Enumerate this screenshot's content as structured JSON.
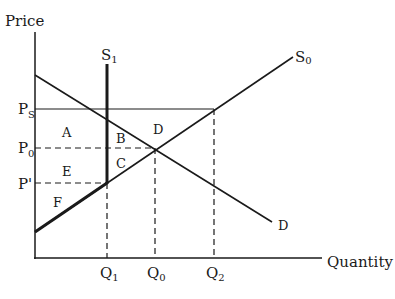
{
  "diagram": {
    "type": "supply-demand",
    "axes": {
      "y_label": "Price",
      "x_label": "Quantity"
    },
    "curves": {
      "demand": {
        "label": "D"
      },
      "supply_original": {
        "label": "S",
        "subscript": "0"
      },
      "supply_restricted": {
        "label": "S",
        "subscript": "1"
      }
    },
    "price_levels": [
      {
        "id": "ps",
        "label": "P",
        "subscript": "S",
        "style": "solid"
      },
      {
        "id": "p0",
        "label": "P",
        "subscript": "0",
        "style": "dashed"
      },
      {
        "id": "pprime",
        "label": "P'",
        "subscript": "",
        "style": "dashed"
      }
    ],
    "quantity_levels": [
      {
        "id": "q1",
        "label": "Q",
        "subscript": "1"
      },
      {
        "id": "q0",
        "label": "Q",
        "subscript": "0"
      },
      {
        "id": "q2",
        "label": "Q",
        "subscript": "2"
      }
    ],
    "regions": {
      "a": "A",
      "b": "B",
      "c": "C",
      "d": "D",
      "e": "E",
      "f": "F"
    },
    "colors": {
      "ink": "#1a1a1a",
      "background": "#ffffff"
    }
  }
}
